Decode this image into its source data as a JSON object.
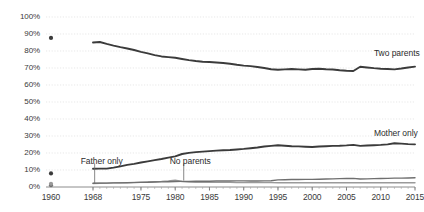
{
  "chart_data": {
    "type": "line",
    "title": "",
    "subtitle": "",
    "xlabel": "",
    "ylabel": "",
    "ylim": [
      0,
      100
    ],
    "xlim": [
      1960,
      2015
    ],
    "grid": true,
    "legend_position": "inline-right",
    "y_ticks": [
      "0%",
      "10%",
      "20%",
      "30%",
      "40%",
      "50%",
      "60%",
      "70%",
      "80%",
      "90%",
      "100%"
    ],
    "y_tick_values": [
      0,
      10,
      20,
      30,
      40,
      50,
      60,
      70,
      80,
      90,
      100
    ],
    "x_ticks": [
      "1960",
      "1968",
      "1975",
      "1980",
      "1985",
      "1990",
      "1995",
      "2000",
      "2005",
      "2010",
      "2015"
    ],
    "x_tick_values": [
      1960,
      1968,
      1975,
      1980,
      1985,
      1990,
      1995,
      2000,
      2005,
      2010,
      2015
    ],
    "x": [
      1968,
      1969,
      1970,
      1971,
      1972,
      1973,
      1974,
      1975,
      1976,
      1977,
      1978,
      1979,
      1980,
      1981,
      1982,
      1983,
      1984,
      1985,
      1986,
      1987,
      1988,
      1989,
      1990,
      1991,
      1992,
      1993,
      1994,
      1995,
      1996,
      1997,
      1998,
      1999,
      2000,
      2001,
      2002,
      2003,
      2004,
      2005,
      2006,
      2007,
      2008,
      2009,
      2010,
      2011,
      2012,
      2013,
      2014,
      2015
    ],
    "series": [
      {
        "name": "Two parents",
        "color": "#3b3b3b",
        "values": [
          85,
          85.3,
          84.2,
          83.2,
          82.3,
          81.5,
          80.6,
          79.5,
          78.6,
          77.6,
          76.8,
          76.4,
          76.0,
          75.3,
          74.6,
          74.1,
          73.7,
          73.5,
          73.2,
          72.9,
          72.5,
          71.9,
          71.4,
          71.1,
          70.6,
          70.0,
          69.3,
          69.0,
          69.2,
          69.4,
          69.2,
          69.0,
          69.4,
          69.6,
          69.3,
          69.1,
          68.7,
          68.4,
          68.2,
          70.7,
          70.3,
          69.9,
          69.6,
          69.4,
          69.2,
          69.7,
          70.3,
          70.8
        ],
        "point_1960": 87.7
      },
      {
        "name": "Mother only",
        "color": "#3b3b3b",
        "values": [
          10.7,
          10.8,
          10.8,
          11.4,
          12.1,
          13.0,
          13.6,
          14.4,
          15.1,
          15.8,
          16.5,
          17.3,
          18.0,
          19.4,
          20.1,
          20.5,
          20.8,
          21.1,
          21.4,
          21.6,
          21.8,
          22.1,
          22.4,
          22.8,
          23.2,
          23.8,
          24.2,
          24.6,
          24.3,
          24.0,
          23.9,
          23.7,
          23.5,
          23.8,
          24.0,
          24.2,
          24.3,
          24.5,
          24.8,
          24.2,
          24.4,
          24.6,
          24.8,
          25.1,
          25.7,
          25.5,
          25.2,
          25.1
        ],
        "point_1960": 8.0
      },
      {
        "name": "Father only",
        "color": "#6f6f6f",
        "values": [
          2.2,
          2.3,
          2.3,
          2.4,
          2.4,
          2.5,
          2.6,
          2.7,
          2.8,
          2.9,
          3.0,
          3.1,
          3.2,
          3.3,
          3.3,
          3.4,
          3.4,
          3.4,
          3.5,
          3.5,
          3.5,
          3.6,
          3.6,
          3.5,
          3.5,
          3.6,
          3.7,
          4.2,
          4.3,
          4.4,
          4.4,
          4.5,
          4.5,
          4.6,
          4.7,
          4.8,
          4.9,
          5.0,
          5.1,
          4.7,
          4.8,
          4.9,
          5.0,
          5.1,
          5.2,
          5.2,
          5.3,
          5.4
        ],
        "point_1960": 1.1
      },
      {
        "name": "No parents",
        "color": "#9a9a9a",
        "values": [
          2.1,
          2.2,
          2.3,
          2.4,
          2.5,
          2.6,
          2.7,
          2.8,
          2.9,
          3.1,
          3.3,
          3.6,
          4.0,
          3.2,
          2.9,
          2.8,
          2.8,
          2.7,
          2.7,
          2.7,
          2.7,
          2.6,
          2.6,
          2.6,
          2.6,
          2.6,
          2.6,
          2.5,
          2.5,
          2.5,
          2.5,
          2.5,
          2.5,
          2.5,
          2.5,
          2.5,
          2.5,
          2.5,
          2.5,
          2.5,
          2.5,
          2.5,
          2.5,
          2.5,
          2.5,
          2.5,
          2.5,
          2.5
        ],
        "point_1960": 1.9
      }
    ],
    "annotations": [
      {
        "label": "Two parents",
        "x": 2009,
        "y": 78
      },
      {
        "label": "Mother only",
        "x": 2009,
        "y": 31
      },
      {
        "label": "Father only",
        "x": 1966.2,
        "y": 15,
        "leader_to_y": 2.2
      },
      {
        "label": "No parents",
        "x": 1979.2,
        "y": 15,
        "leader_to_y": 3.8
      }
    ]
  }
}
